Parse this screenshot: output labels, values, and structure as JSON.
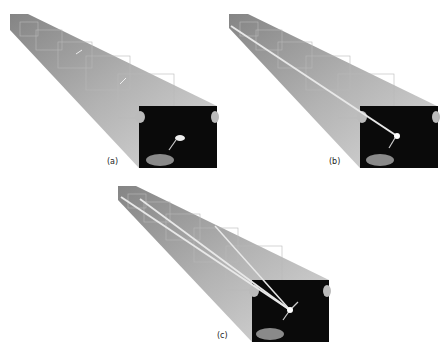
{
  "figure": {
    "panels": [
      {
        "id": "a",
        "label": "(a)",
        "apex": [
          10,
          14
        ],
        "image": {
          "x": 139,
          "y": 106,
          "w": 78,
          "h": 62
        },
        "label_pos": [
          107,
          157
        ],
        "lines": []
      },
      {
        "id": "b",
        "label": "(b)",
        "apex": [
          229,
          14
        ],
        "image": {
          "x": 360,
          "y": 106,
          "w": 78,
          "h": 62
        },
        "label_pos": [
          329,
          157
        ],
        "lines": [
          [
            [
              231,
              26
            ],
            [
              397,
              136
            ]
          ]
        ]
      },
      {
        "id": "c",
        "label": "(c)",
        "apex": [
          118,
          186
        ],
        "image": {
          "x": 252,
          "y": 280,
          "w": 77,
          "h": 62
        },
        "label_pos": [
          217,
          331
        ],
        "lines": [
          [
            [
              121,
              197
            ],
            [
              290,
              310
            ]
          ],
          [
            [
              140,
              199
            ],
            [
              290,
              310
            ]
          ],
          [
            [
              215,
              226
            ],
            [
              290,
              310
            ]
          ]
        ]
      }
    ],
    "colors": {
      "pyramid_light": "#d8d8d8",
      "pyramid_mid": "#a8a8a8",
      "pyramid_dark": "#777777",
      "image_bg": "#0a0a0a",
      "line": "#e8e8e8"
    }
  }
}
